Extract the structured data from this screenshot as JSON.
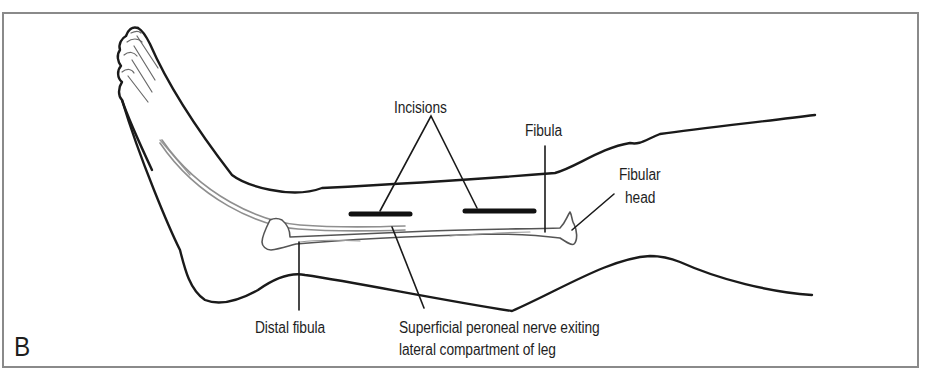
{
  "figure": {
    "panel_letter": "B"
  },
  "labels": {
    "incisions": "Incisions",
    "fibula": "Fibula",
    "fibular_head_line1": "Fibular",
    "fibular_head_line2": "head",
    "distal_fibula": "Distal fibula",
    "nerve_line1": "Superficial peroneal nerve exiting",
    "nerve_line2": "lateral compartment of leg"
  },
  "colors": {
    "outline": "#1a1a1a",
    "incision": "#111111",
    "nerve": "#8f8f8f",
    "bone": "#555555",
    "frame": "#8a8a8a"
  }
}
